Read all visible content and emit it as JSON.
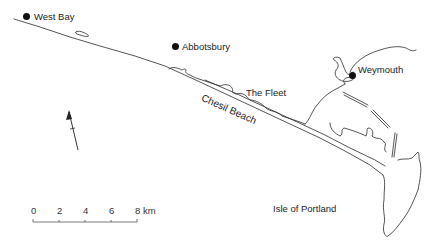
{
  "map": {
    "places": [
      {
        "name": "West Bay",
        "type": "town"
      },
      {
        "name": "Abbotsbury",
        "type": "town"
      },
      {
        "name": "Weymouth",
        "type": "town"
      }
    ],
    "features": [
      {
        "name": "The Fleet",
        "type": "lagoon"
      },
      {
        "name": "Chesil Beach",
        "type": "beach"
      },
      {
        "name": "Isle of Portland",
        "type": "island"
      }
    ],
    "north_arrow": {
      "icon": "north-arrow-icon"
    },
    "scale_bar": {
      "ticks": [
        "0",
        "2",
        "4",
        "6",
        "8"
      ],
      "unit": "km"
    },
    "colors": {
      "line": "#2a2a2a",
      "text": "#222222",
      "background": "#ffffff"
    }
  }
}
